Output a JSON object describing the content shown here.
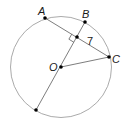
{
  "diagram": {
    "type": "circle-geometry",
    "circle": {
      "center_label": "O",
      "cx": 61,
      "cy": 67,
      "r": 50,
      "stroke": "#9a9a9a"
    },
    "points": [
      {
        "id": "A",
        "label": "A",
        "x": 45,
        "y": 18,
        "label_x": 38,
        "label_y": 12
      },
      {
        "id": "B",
        "label": "B",
        "x": 85,
        "y": 22,
        "label_x": 83,
        "label_y": 16
      },
      {
        "id": "C",
        "label": "C",
        "x": 109,
        "y": 57,
        "label_x": 112,
        "label_y": 63
      },
      {
        "id": "O",
        "label": "O",
        "x": 61,
        "y": 67,
        "label_x": 49,
        "label_y": 71
      },
      {
        "id": "M",
        "label": "",
        "x": 77,
        "y": 37
      },
      {
        "id": "D",
        "label": "",
        "x": 36,
        "y": 110
      }
    ],
    "segments": [
      {
        "from": "A",
        "to": "C",
        "name": "chord-AC"
      },
      {
        "from": "B",
        "to": "D",
        "name": "diameter-BD"
      },
      {
        "from": "O",
        "to": "C",
        "name": "radius-OC"
      }
    ],
    "right_angle_marker": {
      "at": "M"
    },
    "measure_labels": [
      {
        "text": "7",
        "segment": "MC",
        "x": 88,
        "y": 44
      }
    ],
    "colors": {
      "line": "#6e6e6e",
      "point": "#000000",
      "text": "#1a1a1a"
    }
  }
}
